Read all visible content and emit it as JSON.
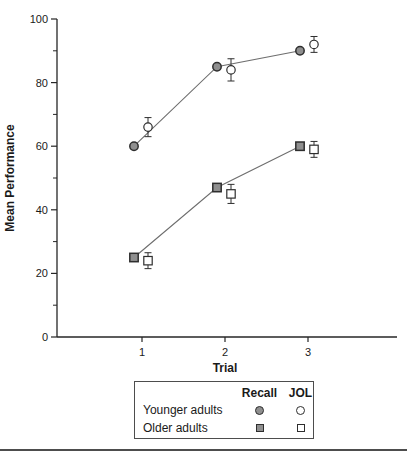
{
  "axes": {
    "y_label": "Mean Performance",
    "x_label": "Trial",
    "y_major_ticks": [
      0,
      20,
      40,
      60,
      80,
      100
    ],
    "y_minor_ticks": [
      10,
      30,
      50,
      70,
      90
    ],
    "x_ticks": [
      1,
      2,
      3
    ],
    "y_range": [
      0,
      100
    ]
  },
  "legend": {
    "col_headers": [
      "Recall",
      "JOL"
    ],
    "rows": [
      {
        "label": "Younger adults",
        "recall_marker": "filled-circle",
        "jol_marker": "open-circle"
      },
      {
        "label": "Older adults",
        "recall_marker": "filled-square",
        "jol_marker": "open-square"
      }
    ]
  },
  "chart_data": {
    "type": "line",
    "title": "",
    "xlabel": "Trial",
    "ylabel": "Mean Performance",
    "x": [
      1,
      2,
      3
    ],
    "ylim": [
      0,
      100
    ],
    "grid": false,
    "legend_position": "bottom-boxed",
    "series": [
      {
        "name": "Younger adults - Recall",
        "group": "Younger adults",
        "measure": "Recall",
        "marker": "filled-circle",
        "connect": true,
        "x_offset_px": -8,
        "values": [
          60,
          85,
          90
        ],
        "errors": [
          0,
          0,
          0
        ]
      },
      {
        "name": "Younger adults - JOL",
        "group": "Younger adults",
        "measure": "JOL",
        "marker": "open-circle",
        "connect": false,
        "x_offset_px": 6,
        "values": [
          66,
          84,
          92
        ],
        "errors": [
          3,
          3.5,
          2.5
        ]
      },
      {
        "name": "Older adults - Recall",
        "group": "Older adults",
        "measure": "Recall",
        "marker": "filled-square",
        "connect": true,
        "x_offset_px": -8,
        "values": [
          25,
          47,
          60
        ],
        "errors": [
          0,
          0,
          0
        ]
      },
      {
        "name": "Older adults - JOL",
        "group": "Older adults",
        "measure": "JOL",
        "marker": "open-square",
        "connect": false,
        "x_offset_px": 6,
        "values": [
          24,
          45,
          59
        ],
        "errors": [
          2.5,
          3,
          2.5
        ]
      }
    ]
  },
  "colors": {
    "marker_fill": "#8f8f8f",
    "marker_open_fill": "#ffffff",
    "marker_stroke": "#2e2e2e",
    "series_line": "#6e6e6e",
    "axis": "#262626",
    "legend_border": "#4d4d4d",
    "bottom_rule": "#4d4d4d"
  }
}
